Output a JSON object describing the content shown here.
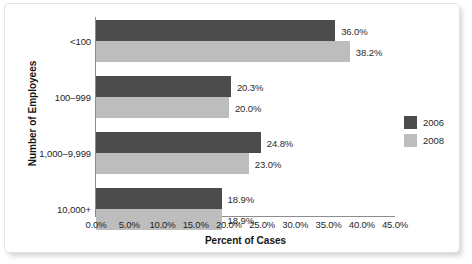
{
  "chart_data": {
    "type": "bar",
    "orientation": "horizontal",
    "title": "",
    "xlabel": "Percent of Cases",
    "ylabel": "Number of Employees",
    "categories": [
      "<100",
      "100–999",
      "1,000–9,999",
      "10,000+"
    ],
    "series": [
      {
        "name": "2006",
        "color": "#4b4b4b",
        "values": [
          36.0,
          20.3,
          24.8,
          18.9
        ],
        "labels": [
          "36.0%",
          "20.3%",
          "24.8%",
          "18.9%"
        ]
      },
      {
        "name": "2008",
        "color": "#bdbdbd",
        "values": [
          38.2,
          20.0,
          23.0,
          18.9
        ],
        "labels": [
          "38.2%",
          "20.0%",
          "23.0%",
          "18.9%"
        ]
      }
    ],
    "xlim": [
      0,
      45
    ],
    "xticks": [
      0,
      5,
      10,
      15,
      20,
      25,
      30,
      35,
      40,
      45
    ],
    "xtick_labels": [
      "0.0%",
      "5.0%",
      "10.0%",
      "15.0%",
      "20.0%",
      "25.0%",
      "30.0%",
      "35.0%",
      "40.0%",
      "45.0%"
    ],
    "grid": false,
    "legend_position": "right",
    "legend_entries": [
      "2006",
      "2008"
    ]
  },
  "axes": {
    "x_title": "Percent of Cases",
    "y_title": "Number of Employees"
  },
  "colors": {
    "series_2006": "#4b4b4b",
    "series_2008": "#bdbdbd",
    "axis_line": "#8d8d8d",
    "card_border": "#e2e2e2",
    "background": "#ffffff"
  }
}
